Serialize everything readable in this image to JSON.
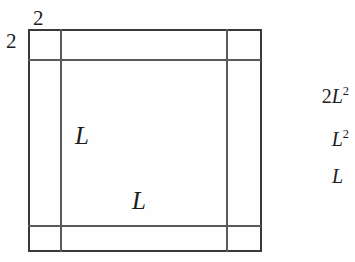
{
  "diagram": {
    "type": "geometry-figure",
    "shape": "square-with-inset-border",
    "line_color": "#3a3a3c",
    "background": "#fefefe",
    "outer_square": {
      "left": 28,
      "top": 29,
      "right": 261,
      "bottom": 251
    },
    "inner_square": {
      "left": 60,
      "top": 60,
      "right": 227,
      "bottom": 226
    },
    "labels": {
      "top_border_width": "2",
      "left_border_width": "2",
      "inner_vertical_side": "L",
      "inner_horizontal_side": "L"
    }
  },
  "answers": {
    "title": "",
    "options": [
      {
        "coefficient": "2",
        "variable": "L",
        "exponent": "2",
        "text": "2L2"
      },
      {
        "coefficient": "",
        "variable": "L",
        "exponent": "2",
        "text": "L2"
      },
      {
        "coefficient": "",
        "variable": "L",
        "exponent": "",
        "text": "L"
      }
    ]
  }
}
